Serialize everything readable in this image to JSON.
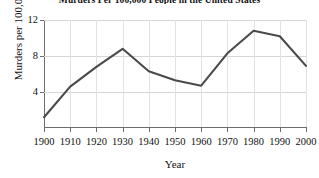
{
  "chart_data": {
    "type": "line",
    "title": "Murders Per 100,000 People in the United States",
    "xlabel": "Year",
    "ylabel": "Murders per 100,000",
    "x": [
      1900,
      1910,
      1920,
      1930,
      1940,
      1950,
      1960,
      1970,
      1980,
      1990,
      2000
    ],
    "values": [
      1.2,
      4.6,
      6.8,
      8.8,
      6.3,
      5.3,
      4.7,
      8.3,
      10.8,
      10.2,
      6.9
    ],
    "series": [
      {
        "name": "Murders per 100,000",
        "values": [
          1.2,
          4.6,
          6.8,
          8.8,
          6.3,
          5.3,
          4.7,
          8.3,
          10.8,
          10.2,
          6.9
        ]
      }
    ],
    "xtick_labels": [
      "1900",
      "1910",
      "1920",
      "1930",
      "1940",
      "1950",
      "1960",
      "1970",
      "1980",
      "1990",
      "2000"
    ],
    "ytick_labels": [
      "4",
      "8",
      "12"
    ],
    "yticks": [
      4,
      8,
      12
    ],
    "xlim": [
      1900,
      2000
    ],
    "ylim": [
      0,
      12
    ],
    "grid": true,
    "legend": false,
    "legend_position": "none",
    "line_color": "#4a4a4a",
    "grid_color": "#d6d6d6",
    "axis_color": "#6d6d6d",
    "background_color": "#ffffff"
  }
}
